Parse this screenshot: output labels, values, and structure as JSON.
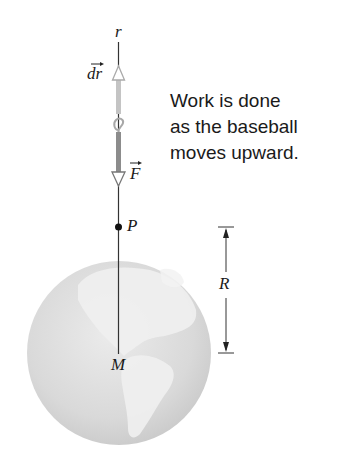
{
  "figure": {
    "caption_lines": [
      "Work is done",
      "as the baseball",
      "moves upward."
    ],
    "labels": {
      "axis": "r",
      "displacement": "dr",
      "force": "F",
      "point": "P",
      "radius": "R",
      "mass": "M"
    },
    "colors": {
      "axis_line": "#333333",
      "displacement_arrow": "#bdbdbd",
      "force_arrow": "#8a8a8a",
      "globe_fill": "#d6d6d6",
      "globe_land": "#ececec",
      "text": "#1a1a1a"
    }
  }
}
